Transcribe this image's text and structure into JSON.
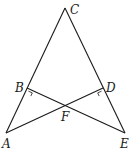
{
  "diagram": {
    "type": "geometry",
    "points": {
      "A": {
        "label": "A",
        "x": 6,
        "y": 133
      },
      "B": {
        "label": "B",
        "x": 27,
        "y": 88
      },
      "C": {
        "label": "C",
        "x": 65,
        "y": 8
      },
      "D": {
        "label": "D",
        "x": 103,
        "y": 88
      },
      "E": {
        "label": "E",
        "x": 125,
        "y": 133
      },
      "F": {
        "label": "F",
        "x": 65,
        "y": 107
      }
    },
    "segments": [
      "AC",
      "CE",
      "AD",
      "BE"
    ],
    "right_angles": [
      "B",
      "D"
    ],
    "labels": {
      "A": "A",
      "B": "B",
      "C": "C",
      "D": "D",
      "E": "E",
      "F": "F"
    }
  }
}
